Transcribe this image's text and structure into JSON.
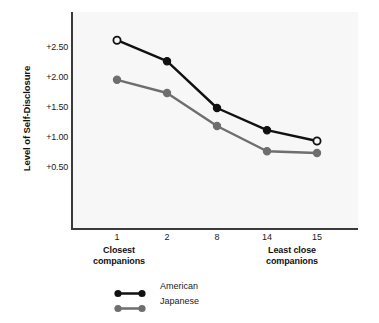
{
  "chart_data": {
    "type": "line",
    "title": "",
    "xlabel": "",
    "ylabel": "Level of Self-Disclosure",
    "categories": [
      "1",
      "2",
      "8",
      "14",
      "15"
    ],
    "x": [
      1,
      2,
      3,
      4,
      5
    ],
    "ylim": [
      0.0,
      3.0
    ],
    "ytick_labels": [
      "+2.50",
      "+2.00",
      "+1.50",
      "+1.00",
      "+0.50"
    ],
    "ytick_values": [
      2.5,
      2.0,
      1.5,
      1.0,
      0.5
    ],
    "grid": false,
    "legend_position": "bottom-center",
    "x_group_labels": [
      {
        "text_line1": "Closest",
        "text_line2": "companions",
        "at_category": "1"
      },
      {
        "text_line1": "Least close",
        "text_line2": "companions",
        "at_category": "14.5"
      }
    ],
    "series": [
      {
        "name": "American",
        "color": "#111111",
        "marker": "circle",
        "marker_fill": [
          "open",
          "filled",
          "filled",
          "filled",
          "open"
        ],
        "values": [
          2.63,
          2.28,
          1.5,
          1.13,
          0.95
        ]
      },
      {
        "name": "Japanese",
        "color": "#6e6e6e",
        "marker": "circle",
        "marker_fill": [
          "filled",
          "filled",
          "filled",
          "filled",
          "filled"
        ],
        "values": [
          1.97,
          1.75,
          1.2,
          0.78,
          0.75
        ]
      }
    ]
  },
  "axis": {
    "y_title": "Level of Self-Disclosure",
    "y_tick_labels": [
      "+2.50",
      "+2.00",
      "+1.50",
      "+1.00",
      "+0.50"
    ],
    "x_tick_labels": [
      "1",
      "2",
      "8",
      "14",
      "15"
    ],
    "x_group_left_line1": "Closest",
    "x_group_left_line2": "companions",
    "x_group_right_line1": "Least close",
    "x_group_right_line2": "companions"
  },
  "legend": {
    "items": [
      {
        "label": "American",
        "color": "#111111"
      },
      {
        "label": "Japanese",
        "color": "#6e6e6e"
      }
    ]
  },
  "colors": {
    "american": "#111111",
    "japanese": "#6e6e6e",
    "axis": "#3a3a3a",
    "plot_background": "#f7f7f7",
    "page_background": "#ffffff",
    "text": "#1a1a1a"
  }
}
